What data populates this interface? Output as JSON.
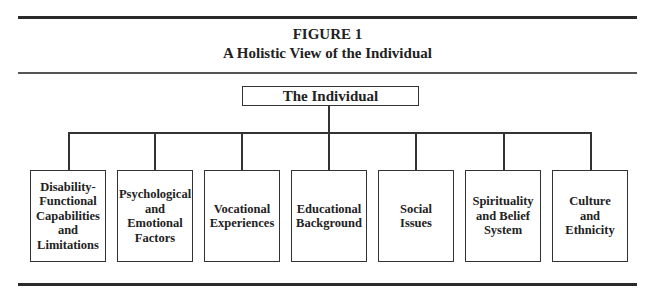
{
  "figure": {
    "label": "FIGURE 1",
    "title": "A Holistic View of the Individual"
  },
  "root": {
    "label": "The Individual"
  },
  "children": [
    {
      "label": "Disability-\nFunctional\nCapabilities\nand\nLimitations"
    },
    {
      "label": "Psychological\nand\nEmotional\nFactors"
    },
    {
      "label": "Vocational\nExperiences"
    },
    {
      "label": "Educational\nBackground"
    },
    {
      "label": "Social\nIssues"
    },
    {
      "label": "Spirituality\nand Belief\nSystem"
    },
    {
      "label": "Culture\nand\nEthnicity"
    }
  ]
}
